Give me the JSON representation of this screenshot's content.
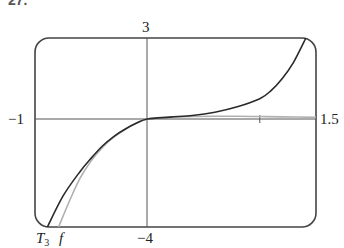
{
  "problem_label": "27.",
  "chart_data": {
    "type": "line",
    "title": "",
    "xlabel": "",
    "ylabel": "",
    "xlim": [
      -1,
      1.5
    ],
    "ylim": [
      -4,
      3
    ],
    "grid": false,
    "axis_labels": {
      "x_min": "−1",
      "x_max": "1.5",
      "y_min": "−4",
      "y_max": "3"
    },
    "x_ticks": [
      1
    ],
    "series": [
      {
        "name": "T3",
        "label": "T",
        "subscript": "3",
        "color": "#2a2a2a",
        "x": [
          -0.89,
          -0.75,
          -0.6,
          -0.5,
          -0.4,
          -0.3,
          -0.2,
          -0.1,
          0,
          0.2,
          0.4,
          0.6,
          0.8,
          1.0,
          1.1,
          1.2,
          1.3,
          1.41
        ],
        "y": [
          -4.0,
          -2.85,
          -1.95,
          -1.45,
          -1.0,
          -0.65,
          -0.38,
          -0.16,
          0,
          0.07,
          0.13,
          0.25,
          0.45,
          0.75,
          1.05,
          1.5,
          2.1,
          3.0
        ]
      },
      {
        "name": "f",
        "label": "f",
        "color": "#b0b0b0",
        "x": [
          -0.79,
          -0.7,
          -0.6,
          -0.5,
          -0.4,
          -0.3,
          -0.2,
          -0.1,
          0,
          0.2,
          0.4,
          0.6,
          0.8,
          1.0,
          1.2,
          1.5
        ],
        "y": [
          -4.0,
          -3.1,
          -2.2,
          -1.55,
          -1.05,
          -0.67,
          -0.39,
          -0.16,
          0,
          0.06,
          0.09,
          0.1,
          0.1,
          0.09,
          0.08,
          0.06
        ]
      }
    ],
    "legend": "curve labels at bottom: T3 and f"
  }
}
